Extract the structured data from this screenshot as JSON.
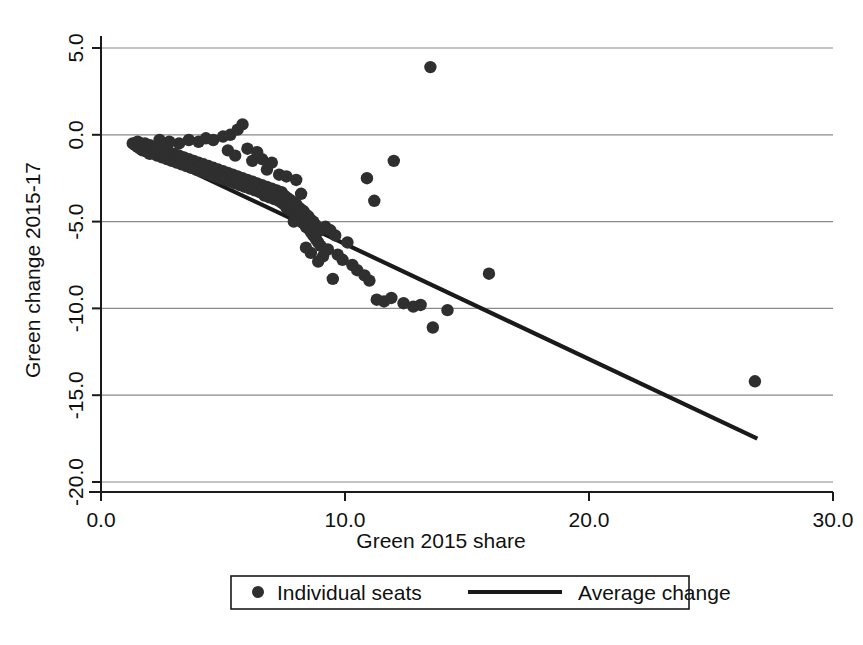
{
  "chart_data": {
    "type": "scatter",
    "title": "",
    "xlabel": "Green 2015 share",
    "ylabel": "Green change 2015-17",
    "xlim": [
      0.0,
      30.0
    ],
    "ylim": [
      -20.0,
      5.0
    ],
    "xticks": [
      "0.0",
      "10.0",
      "20.0",
      "30.0"
    ],
    "xtick_values": [
      0.0,
      10.0,
      20.0,
      30.0
    ],
    "yticks": [
      "5.0",
      "0.0",
      "-5.0",
      "-10.0",
      "-15.0",
      "-20.0"
    ],
    "ytick_values": [
      5.0,
      0.0,
      -5.0,
      -10.0,
      -15.0,
      -20.0
    ],
    "grid": "horizontal",
    "legend_position": "below-axis",
    "marker_color": "#2f2f2f",
    "line_color": "#1a1a1a",
    "grid_color": "#8a8a8a",
    "axis_color": "#1a1a1a",
    "background_color": "#ffffff",
    "legend": [
      {
        "label": "Individual seats",
        "marker": "dot"
      },
      {
        "label": "Average change",
        "marker": "line"
      }
    ],
    "series": [
      {
        "name": "Individual seats",
        "type": "scatter",
        "points": [
          [
            1.3,
            -0.5
          ],
          [
            1.4,
            -0.6
          ],
          [
            1.5,
            -0.4
          ],
          [
            1.5,
            -0.7
          ],
          [
            1.6,
            -0.5
          ],
          [
            1.6,
            -0.8
          ],
          [
            1.7,
            -0.6
          ],
          [
            1.7,
            -0.9
          ],
          [
            1.8,
            -0.5
          ],
          [
            1.8,
            -0.8
          ],
          [
            1.9,
            -0.7
          ],
          [
            1.9,
            -1.0
          ],
          [
            2.0,
            -0.6
          ],
          [
            2.0,
            -0.9
          ],
          [
            2.0,
            -1.1
          ],
          [
            2.1,
            -0.7
          ],
          [
            2.1,
            -1.0
          ],
          [
            2.2,
            -0.8
          ],
          [
            2.2,
            -1.1
          ],
          [
            2.3,
            -0.9
          ],
          [
            2.3,
            -1.2
          ],
          [
            2.4,
            -0.8
          ],
          [
            2.4,
            -1.1
          ],
          [
            2.5,
            -0.9
          ],
          [
            2.5,
            -1.3
          ],
          [
            2.6,
            -1.0
          ],
          [
            2.6,
            -1.2
          ],
          [
            2.7,
            -1.1
          ],
          [
            2.7,
            -1.4
          ],
          [
            2.8,
            -1.0
          ],
          [
            2.8,
            -1.3
          ],
          [
            2.9,
            -1.2
          ],
          [
            2.9,
            -1.5
          ],
          [
            3.0,
            -1.1
          ],
          [
            3.0,
            -1.4
          ],
          [
            3.1,
            -1.3
          ],
          [
            3.1,
            -1.6
          ],
          [
            3.2,
            -1.2
          ],
          [
            3.2,
            -1.5
          ],
          [
            3.3,
            -1.4
          ],
          [
            3.3,
            -1.7
          ],
          [
            3.4,
            -1.3
          ],
          [
            3.4,
            -1.6
          ],
          [
            3.5,
            -1.5
          ],
          [
            3.5,
            -1.8
          ],
          [
            3.6,
            -1.4
          ],
          [
            3.6,
            -1.7
          ],
          [
            3.7,
            -1.6
          ],
          [
            3.7,
            -1.9
          ],
          [
            3.8,
            -1.5
          ],
          [
            3.8,
            -1.8
          ],
          [
            3.9,
            -1.7
          ],
          [
            3.9,
            -2.0
          ],
          [
            4.0,
            -1.6
          ],
          [
            4.0,
            -1.9
          ],
          [
            4.1,
            -1.8
          ],
          [
            4.1,
            -2.1
          ],
          [
            4.2,
            -1.7
          ],
          [
            4.2,
            -2.0
          ],
          [
            4.3,
            -1.9
          ],
          [
            4.3,
            -2.2
          ],
          [
            4.4,
            -1.8
          ],
          [
            4.4,
            -2.1
          ],
          [
            4.5,
            -2.0
          ],
          [
            4.5,
            -2.3
          ],
          [
            4.6,
            -1.9
          ],
          [
            4.6,
            -2.2
          ],
          [
            4.7,
            -2.1
          ],
          [
            4.7,
            -2.4
          ],
          [
            4.8,
            -2.0
          ],
          [
            4.8,
            -2.3
          ],
          [
            4.9,
            -2.2
          ],
          [
            4.9,
            -2.5
          ],
          [
            5.0,
            -2.1
          ],
          [
            5.0,
            -2.4
          ],
          [
            5.1,
            -2.3
          ],
          [
            5.1,
            -2.6
          ],
          [
            5.2,
            -2.2
          ],
          [
            5.2,
            -2.5
          ],
          [
            5.3,
            -2.4
          ],
          [
            5.3,
            -2.7
          ],
          [
            5.4,
            -2.3
          ],
          [
            5.4,
            -2.6
          ],
          [
            5.5,
            -2.5
          ],
          [
            5.5,
            -2.8
          ],
          [
            5.6,
            -2.4
          ],
          [
            5.6,
            -2.7
          ],
          [
            5.7,
            -2.6
          ],
          [
            5.7,
            -2.9
          ],
          [
            5.8,
            -2.5
          ],
          [
            5.8,
            -2.8
          ],
          [
            5.9,
            -2.7
          ],
          [
            5.9,
            -3.0
          ],
          [
            6.0,
            -2.6
          ],
          [
            6.0,
            -2.9
          ],
          [
            6.1,
            -2.8
          ],
          [
            6.1,
            -3.1
          ],
          [
            6.2,
            -2.7
          ],
          [
            6.2,
            -3.0
          ],
          [
            6.3,
            -2.9
          ],
          [
            6.3,
            -3.2
          ],
          [
            6.4,
            -2.8
          ],
          [
            6.4,
            -3.1
          ],
          [
            6.5,
            -3.0
          ],
          [
            6.5,
            -3.3
          ],
          [
            6.6,
            -2.9
          ],
          [
            6.6,
            -3.2
          ],
          [
            6.7,
            -3.1
          ],
          [
            6.7,
            -3.5
          ],
          [
            6.8,
            -3.0
          ],
          [
            6.8,
            -3.4
          ],
          [
            6.9,
            -3.2
          ],
          [
            6.9,
            -3.6
          ],
          [
            7.0,
            -3.1
          ],
          [
            7.0,
            -3.5
          ],
          [
            7.1,
            -3.3
          ],
          [
            7.1,
            -3.7
          ],
          [
            7.2,
            -3.2
          ],
          [
            7.2,
            -3.6
          ],
          [
            7.3,
            -3.4
          ],
          [
            7.3,
            -3.8
          ],
          [
            7.4,
            -3.3
          ],
          [
            7.4,
            -3.9
          ],
          [
            7.5,
            -3.5
          ],
          [
            7.5,
            -4.0
          ],
          [
            7.6,
            -3.6
          ],
          [
            7.6,
            -4.2
          ],
          [
            7.7,
            -3.7
          ],
          [
            7.7,
            -4.3
          ],
          [
            7.8,
            -3.8
          ],
          [
            7.8,
            -4.4
          ],
          [
            7.9,
            -3.9
          ],
          [
            7.9,
            -4.5
          ],
          [
            8.0,
            -4.0
          ],
          [
            8.0,
            -4.6
          ],
          [
            8.1,
            -4.2
          ],
          [
            8.1,
            -4.8
          ],
          [
            8.2,
            -4.3
          ],
          [
            8.2,
            -5.0
          ],
          [
            8.3,
            -4.4
          ],
          [
            8.3,
            -5.1
          ],
          [
            8.4,
            -4.6
          ],
          [
            8.4,
            -5.3
          ],
          [
            8.5,
            -4.7
          ],
          [
            8.5,
            -5.4
          ],
          [
            8.6,
            -4.9
          ],
          [
            8.6,
            -5.6
          ],
          [
            8.7,
            -5.0
          ],
          [
            8.7,
            -5.8
          ],
          [
            8.8,
            -5.2
          ],
          [
            8.8,
            -6.0
          ],
          [
            8.9,
            -5.4
          ],
          [
            8.9,
            -6.2
          ],
          [
            9.0,
            -5.5
          ],
          [
            9.0,
            -6.4
          ],
          [
            4.3,
            -0.2
          ],
          [
            4.6,
            -0.3
          ],
          [
            5.0,
            -0.1
          ],
          [
            5.3,
            0.0
          ],
          [
            5.6,
            0.3
          ],
          [
            5.8,
            0.6
          ],
          [
            5.2,
            -0.9
          ],
          [
            5.5,
            -1.2
          ],
          [
            6.2,
            -1.5
          ],
          [
            6.6,
            -1.4
          ],
          [
            6.0,
            -0.8
          ],
          [
            6.4,
            -1.0
          ],
          [
            7.0,
            -1.6
          ],
          [
            6.8,
            -2.0
          ],
          [
            7.3,
            -2.3
          ],
          [
            4.0,
            -0.4
          ],
          [
            3.6,
            -0.3
          ],
          [
            3.2,
            -0.5
          ],
          [
            2.8,
            -0.4
          ],
          [
            2.4,
            -0.3
          ],
          [
            9.2,
            -5.3
          ],
          [
            9.4,
            -5.5
          ],
          [
            9.6,
            -5.8
          ],
          [
            9.3,
            -6.6
          ],
          [
            9.7,
            -6.9
          ],
          [
            9.9,
            -7.2
          ],
          [
            10.1,
            -6.2
          ],
          [
            10.3,
            -7.5
          ],
          [
            10.5,
            -7.8
          ],
          [
            9.1,
            -7.0
          ],
          [
            8.6,
            -6.8
          ],
          [
            8.4,
            -6.5
          ],
          [
            8.9,
            -7.3
          ],
          [
            10.8,
            -8.1
          ],
          [
            11.0,
            -8.4
          ],
          [
            11.3,
            -9.5
          ],
          [
            11.6,
            -9.6
          ],
          [
            11.9,
            -9.4
          ],
          [
            12.4,
            -9.7
          ],
          [
            12.8,
            -9.9
          ],
          [
            13.1,
            -9.8
          ],
          [
            14.2,
            -10.1
          ],
          [
            13.6,
            -11.1
          ],
          [
            13.5,
            3.9
          ],
          [
            12.0,
            -1.5
          ],
          [
            11.2,
            -3.8
          ],
          [
            10.9,
            -2.5
          ],
          [
            15.9,
            -8.0
          ],
          [
            26.8,
            -14.2
          ],
          [
            7.6,
            -2.4
          ],
          [
            8.0,
            -2.6
          ],
          [
            8.2,
            -3.4
          ],
          [
            7.9,
            -5.0
          ],
          [
            9.5,
            -8.3
          ]
        ]
      },
      {
        "name": "Average change",
        "type": "line",
        "points": [
          [
            1.35,
            -0.55
          ],
          [
            26.9,
            -17.5
          ]
        ]
      }
    ]
  }
}
